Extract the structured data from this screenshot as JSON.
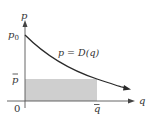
{
  "diagram": {
    "type": "demand-curve",
    "colors": {
      "axis": "#555555",
      "curve": "#2a2a2a",
      "shade": "#cfcfcf",
      "text": "#333333",
      "background": "#ffffff"
    },
    "axes": {
      "x_label": "q",
      "y_label": "p",
      "origin_label": "0"
    },
    "curve": {
      "label": "p = D(q)",
      "intercept_label": "p",
      "intercept_subscript": "0"
    },
    "markers": {
      "p_bar": "p",
      "q_bar": "q"
    },
    "shaded_region": "rectangle from origin to (q̄, p̄)"
  }
}
